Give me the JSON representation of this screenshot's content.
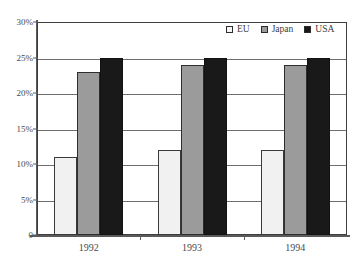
{
  "chart_data": {
    "type": "bar",
    "title": "",
    "subtitle": "",
    "xlabel": "",
    "ylabel": "",
    "categories": [
      "1992",
      "1993",
      "1994"
    ],
    "series": [
      {
        "name": "EU",
        "values": [
          11,
          12,
          12
        ],
        "color": "#f1f1f1"
      },
      {
        "name": "Japan",
        "values": [
          23,
          24,
          24
        ],
        "color": "#9b9b9b"
      },
      {
        "name": "USA",
        "values": [
          25,
          25,
          25
        ],
        "color": "#191919"
      }
    ],
    "ylim": [
      0,
      30
    ],
    "yticks": [
      0,
      5,
      10,
      15,
      20,
      25,
      30
    ],
    "ytick_labels": [
      "0",
      "5%",
      "10%",
      "15%",
      "20%",
      "25%",
      "30%"
    ],
    "grid": true,
    "grid_axis": "y",
    "legend_position": "top-right",
    "value_unit": "%"
  },
  "axes": {
    "y": {
      "labels": [
        "30%",
        "25%",
        "20%",
        "15%",
        "10%",
        "5%",
        "0"
      ]
    },
    "x": {
      "labels": [
        "1992",
        "1993",
        "1994"
      ]
    }
  },
  "legend": {
    "items": [
      {
        "label": "EU"
      },
      {
        "label": "Japan"
      },
      {
        "label": "USA"
      }
    ]
  },
  "artifact": {
    "top_edge_text": "· ·              ·   ·"
  }
}
